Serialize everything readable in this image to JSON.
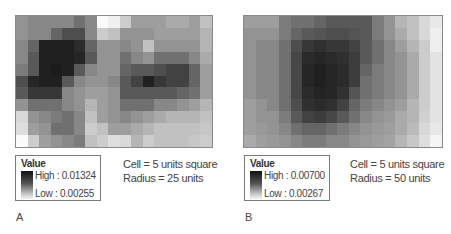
{
  "figure": {
    "panels": [
      {
        "id": "A",
        "label": "A",
        "legend": {
          "title": "Value",
          "high_label": "High : 0.01324",
          "low_label": "Low : 0.00255",
          "high_value": 0.01324,
          "low_value": 0.00255
        },
        "caption_lines": [
          "Cell = 5 units square",
          "Radius = 25 units"
        ],
        "raster": {
          "cols": 17,
          "rows": 11,
          "darkness": [
            [
              0.45,
              0.5,
              0.5,
              0.5,
              0.5,
              0.6,
              0.5,
              0.0,
              0.05,
              0.2,
              0.4,
              0.4,
              0.4,
              0.35,
              0.35,
              0.4,
              0.25
            ],
            [
              0.45,
              0.5,
              0.5,
              0.65,
              0.75,
              0.75,
              0.5,
              0.2,
              0.25,
              0.45,
              0.45,
              0.45,
              0.4,
              0.4,
              0.4,
              0.4,
              0.3
            ],
            [
              0.5,
              0.65,
              0.95,
              0.95,
              0.95,
              0.9,
              0.65,
              0.45,
              0.45,
              0.5,
              0.45,
              0.25,
              0.45,
              0.45,
              0.45,
              0.45,
              0.3
            ],
            [
              0.5,
              0.7,
              0.95,
              0.95,
              0.95,
              0.92,
              0.7,
              0.45,
              0.45,
              0.6,
              0.5,
              0.45,
              0.6,
              0.6,
              0.6,
              0.5,
              0.35
            ],
            [
              0.55,
              0.7,
              0.95,
              0.97,
              0.95,
              0.7,
              0.5,
              0.45,
              0.45,
              0.65,
              0.7,
              0.7,
              0.75,
              0.8,
              0.8,
              0.65,
              0.4
            ],
            [
              0.75,
              0.92,
              0.95,
              0.95,
              0.7,
              0.5,
              0.45,
              0.45,
              0.5,
              0.7,
              0.8,
              0.95,
              0.85,
              0.8,
              0.8,
              0.65,
              0.4
            ],
            [
              0.7,
              0.85,
              0.85,
              0.85,
              0.5,
              0.45,
              0.4,
              0.4,
              0.45,
              0.7,
              0.7,
              0.7,
              0.7,
              0.7,
              0.65,
              0.6,
              0.4
            ],
            [
              0.45,
              0.6,
              0.6,
              0.6,
              0.5,
              0.45,
              0.3,
              0.4,
              0.45,
              0.6,
              0.6,
              0.6,
              0.5,
              0.5,
              0.45,
              0.4,
              0.3
            ],
            [
              0.15,
              0.45,
              0.5,
              0.55,
              0.6,
              0.5,
              0.25,
              0.4,
              0.45,
              0.5,
              0.45,
              0.4,
              0.35,
              0.3,
              0.3,
              0.3,
              0.25
            ],
            [
              0.12,
              0.4,
              0.45,
              0.6,
              0.6,
              0.5,
              0.2,
              0.25,
              0.4,
              0.4,
              0.35,
              0.3,
              0.25,
              0.25,
              0.25,
              0.25,
              0.22
            ],
            [
              0.0,
              0.2,
              0.4,
              0.45,
              0.5,
              0.55,
              0.25,
              0.2,
              0.12,
              0.15,
              0.3,
              0.2,
              0.25,
              0.25,
              0.25,
              0.22,
              0.2
            ]
          ]
        }
      },
      {
        "id": "B",
        "label": "B",
        "legend": {
          "title": "Value",
          "high_label": "High : 0.00700",
          "low_label": "Low : 0.00267",
          "high_value": 0.007,
          "low_value": 0.00267
        },
        "caption_lines": [
          "Cell = 5 units square",
          "Radius = 50 units"
        ],
        "raster": {
          "cols": 17,
          "rows": 11,
          "darkness": [
            [
              0.4,
              0.4,
              0.4,
              0.55,
              0.6,
              0.6,
              0.65,
              0.7,
              0.7,
              0.7,
              0.7,
              0.55,
              0.45,
              0.3,
              0.25,
              0.15,
              0.08
            ],
            [
              0.45,
              0.45,
              0.45,
              0.55,
              0.65,
              0.7,
              0.72,
              0.75,
              0.75,
              0.72,
              0.7,
              0.55,
              0.45,
              0.35,
              0.25,
              0.15,
              0.05
            ],
            [
              0.45,
              0.5,
              0.5,
              0.6,
              0.75,
              0.85,
              0.88,
              0.85,
              0.85,
              0.8,
              0.7,
              0.6,
              0.5,
              0.4,
              0.3,
              0.2,
              0.05
            ],
            [
              0.45,
              0.5,
              0.5,
              0.6,
              0.78,
              0.9,
              0.92,
              0.9,
              0.88,
              0.82,
              0.7,
              0.6,
              0.5,
              0.45,
              0.35,
              0.2,
              0.1
            ],
            [
              0.45,
              0.5,
              0.5,
              0.6,
              0.78,
              0.92,
              0.95,
              0.92,
              0.9,
              0.82,
              0.65,
              0.55,
              0.5,
              0.45,
              0.35,
              0.2,
              0.1
            ],
            [
              0.45,
              0.5,
              0.5,
              0.6,
              0.78,
              0.92,
              0.95,
              0.92,
              0.9,
              0.82,
              0.6,
              0.55,
              0.5,
              0.45,
              0.35,
              0.2,
              0.1
            ],
            [
              0.45,
              0.5,
              0.5,
              0.6,
              0.78,
              0.9,
              0.93,
              0.92,
              0.88,
              0.72,
              0.6,
              0.55,
              0.5,
              0.45,
              0.35,
              0.2,
              0.1
            ],
            [
              0.4,
              0.45,
              0.5,
              0.6,
              0.75,
              0.88,
              0.9,
              0.88,
              0.8,
              0.65,
              0.55,
              0.5,
              0.45,
              0.4,
              0.3,
              0.2,
              0.1
            ],
            [
              0.4,
              0.45,
              0.45,
              0.55,
              0.7,
              0.8,
              0.82,
              0.78,
              0.7,
              0.6,
              0.5,
              0.45,
              0.42,
              0.35,
              0.3,
              0.18,
              0.1
            ],
            [
              0.4,
              0.42,
              0.45,
              0.5,
              0.6,
              0.65,
              0.65,
              0.6,
              0.55,
              0.5,
              0.45,
              0.42,
              0.4,
              0.35,
              0.28,
              0.15,
              0.08
            ],
            [
              0.35,
              0.4,
              0.42,
              0.45,
              0.5,
              0.55,
              0.55,
              0.5,
              0.5,
              0.45,
              0.42,
              0.4,
              0.38,
              0.3,
              0.22,
              0.12,
              0.02
            ]
          ]
        }
      }
    ]
  }
}
